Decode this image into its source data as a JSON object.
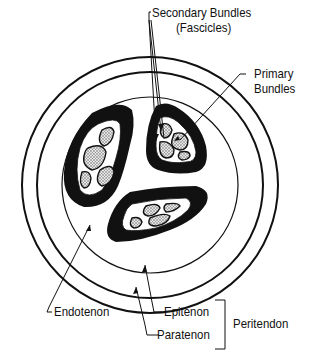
{
  "diagram": {
    "labels": {
      "secondary_bundles": "Secondary Bundles",
      "fascicles": "(Fascicles)",
      "primary": "Primary",
      "bundles": "Bundles",
      "endotenon": "Endotenon",
      "epitenon": "Epitenon",
      "paratenon": "Paratenon",
      "peritendon": "Peritendon"
    },
    "colors": {
      "line": "#111111",
      "fill_dark": "#111111",
      "background": "#ffffff",
      "stipple": "#bdbdbd"
    }
  }
}
